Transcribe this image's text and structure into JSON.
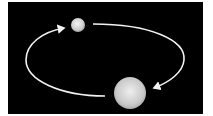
{
  "diagram": {
    "type": "binary-orbit",
    "background_color": "#000000",
    "page_color": "#ffffff",
    "orbit_color": "#f2f2f2",
    "bodies": [
      {
        "name": "small-body",
        "cx": 78,
        "cy": 25,
        "r": 7,
        "color": "#d8d8d8"
      },
      {
        "name": "large-body",
        "cx": 130,
        "cy": 93,
        "r": 16,
        "color": "#d0d0d0"
      }
    ],
    "arrows": [
      {
        "name": "orbit-arc-right",
        "direction": "clockwise",
        "from": "top-right",
        "to": "bottom-right"
      },
      {
        "name": "orbit-arc-left",
        "direction": "clockwise",
        "from": "bottom-left",
        "to": "top-left"
      }
    ],
    "labels": []
  }
}
